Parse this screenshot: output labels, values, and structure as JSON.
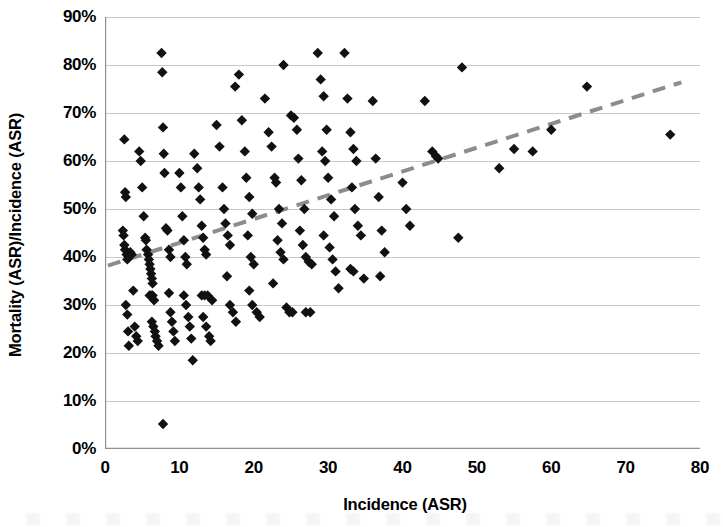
{
  "chart_data": {
    "type": "scatter",
    "title": "",
    "xlabel": "Incidence (ASR)",
    "ylabel": "Mortality (ASR)/Incidence (ASR)",
    "xlim": [
      0,
      80
    ],
    "ylim": [
      0,
      0.9
    ],
    "xticks": [
      "0",
      "10",
      "20",
      "30",
      "40",
      "50",
      "60",
      "70",
      "80"
    ],
    "xtick_values": [
      0,
      10,
      20,
      30,
      40,
      50,
      60,
      70,
      80
    ],
    "yticks": [
      "0%",
      "10%",
      "20%",
      "30%",
      "40%",
      "50%",
      "60%",
      "70%",
      "80%",
      "90%"
    ],
    "ytick_values": [
      0,
      0.1,
      0.2,
      0.3,
      0.4,
      0.5,
      0.6,
      0.7,
      0.8,
      0.9
    ],
    "grid": "horizontal",
    "legend": "none",
    "marker": {
      "shape": "diamond",
      "color": "#111111",
      "size": 8
    },
    "trendline": {
      "type": "linear",
      "style": "dashed",
      "color": "#8c8c8c",
      "width": 4,
      "x_start": 0.4,
      "y_start": 0.382,
      "x_end": 77.5,
      "y_end": 0.764
    },
    "points": [
      [
        2.6,
        0.645
      ],
      [
        2.7,
        0.535
      ],
      [
        2.8,
        0.525
      ],
      [
        2.4,
        0.455
      ],
      [
        2.5,
        0.445
      ],
      [
        2.6,
        0.425
      ],
      [
        2.7,
        0.415
      ],
      [
        2.9,
        0.405
      ],
      [
        3.0,
        0.395
      ],
      [
        2.8,
        0.3
      ],
      [
        3.0,
        0.28
      ],
      [
        3.1,
        0.245
      ],
      [
        3.2,
        0.215
      ],
      [
        3.4,
        0.41
      ],
      [
        3.6,
        0.405
      ],
      [
        3.8,
        0.33
      ],
      [
        4.0,
        0.255
      ],
      [
        4.2,
        0.235
      ],
      [
        4.4,
        0.225
      ],
      [
        4.6,
        0.62
      ],
      [
        4.8,
        0.6
      ],
      [
        5.0,
        0.545
      ],
      [
        5.2,
        0.485
      ],
      [
        5.4,
        0.44
      ],
      [
        5.5,
        0.435
      ],
      [
        5.6,
        0.415
      ],
      [
        5.8,
        0.405
      ],
      [
        5.9,
        0.395
      ],
      [
        6.0,
        0.385
      ],
      [
        6.1,
        0.375
      ],
      [
        6.2,
        0.365
      ],
      [
        6.3,
        0.355
      ],
      [
        6.4,
        0.345
      ],
      [
        6.0,
        0.32
      ],
      [
        6.2,
        0.32
      ],
      [
        6.4,
        0.32
      ],
      [
        6.6,
        0.31
      ],
      [
        6.3,
        0.265
      ],
      [
        6.5,
        0.255
      ],
      [
        6.7,
        0.245
      ],
      [
        6.8,
        0.235
      ],
      [
        7.0,
        0.225
      ],
      [
        7.2,
        0.215
      ],
      [
        7.6,
        0.825
      ],
      [
        7.7,
        0.785
      ],
      [
        7.8,
        0.67
      ],
      [
        7.9,
        0.615
      ],
      [
        8.0,
        0.575
      ],
      [
        8.2,
        0.46
      ],
      [
        8.4,
        0.455
      ],
      [
        8.6,
        0.415
      ],
      [
        8.8,
        0.4
      ],
      [
        8.6,
        0.325
      ],
      [
        8.8,
        0.285
      ],
      [
        9.0,
        0.265
      ],
      [
        9.2,
        0.245
      ],
      [
        9.4,
        0.225
      ],
      [
        7.8,
        0.052
      ],
      [
        10.0,
        0.575
      ],
      [
        10.2,
        0.545
      ],
      [
        10.4,
        0.485
      ],
      [
        10.6,
        0.435
      ],
      [
        10.8,
        0.4
      ],
      [
        11.0,
        0.385
      ],
      [
        10.6,
        0.32
      ],
      [
        10.9,
        0.3
      ],
      [
        11.2,
        0.275
      ],
      [
        11.4,
        0.255
      ],
      [
        11.6,
        0.23
      ],
      [
        11.8,
        0.185
      ],
      [
        12.0,
        0.615
      ],
      [
        12.4,
        0.585
      ],
      [
        12.6,
        0.545
      ],
      [
        12.8,
        0.52
      ],
      [
        13.0,
        0.465
      ],
      [
        13.2,
        0.44
      ],
      [
        13.4,
        0.415
      ],
      [
        13.6,
        0.405
      ],
      [
        13.0,
        0.32
      ],
      [
        13.4,
        0.32
      ],
      [
        13.8,
        0.32
      ],
      [
        13.2,
        0.275
      ],
      [
        13.6,
        0.255
      ],
      [
        14.0,
        0.235
      ],
      [
        14.2,
        0.225
      ],
      [
        14.4,
        0.31
      ],
      [
        15.0,
        0.675
      ],
      [
        15.4,
        0.63
      ],
      [
        15.8,
        0.545
      ],
      [
        16.0,
        0.5
      ],
      [
        16.2,
        0.47
      ],
      [
        16.5,
        0.445
      ],
      [
        16.8,
        0.425
      ],
      [
        16.4,
        0.36
      ],
      [
        16.8,
        0.3
      ],
      [
        17.2,
        0.285
      ],
      [
        17.6,
        0.265
      ],
      [
        17.5,
        0.755
      ],
      [
        18.0,
        0.78
      ],
      [
        18.4,
        0.685
      ],
      [
        18.8,
        0.62
      ],
      [
        19.0,
        0.565
      ],
      [
        19.4,
        0.525
      ],
      [
        19.8,
        0.49
      ],
      [
        19.2,
        0.445
      ],
      [
        19.6,
        0.4
      ],
      [
        20.0,
        0.385
      ],
      [
        19.4,
        0.33
      ],
      [
        19.8,
        0.3
      ],
      [
        20.4,
        0.285
      ],
      [
        20.8,
        0.275
      ],
      [
        21.5,
        0.73
      ],
      [
        22.0,
        0.66
      ],
      [
        22.4,
        0.63
      ],
      [
        22.8,
        0.565
      ],
      [
        23.0,
        0.555
      ],
      [
        23.4,
        0.5
      ],
      [
        23.8,
        0.47
      ],
      [
        23.2,
        0.435
      ],
      [
        23.6,
        0.41
      ],
      [
        24.0,
        0.395
      ],
      [
        22.6,
        0.345
      ],
      [
        24.4,
        0.295
      ],
      [
        24.8,
        0.285
      ],
      [
        25.2,
        0.285
      ],
      [
        24.0,
        0.8
      ],
      [
        25.0,
        0.695
      ],
      [
        25.4,
        0.69
      ],
      [
        25.8,
        0.665
      ],
      [
        26.0,
        0.605
      ],
      [
        26.4,
        0.56
      ],
      [
        26.8,
        0.5
      ],
      [
        26.2,
        0.455
      ],
      [
        26.6,
        0.425
      ],
      [
        27.0,
        0.4
      ],
      [
        27.4,
        0.39
      ],
      [
        27.8,
        0.385
      ],
      [
        27.0,
        0.285
      ],
      [
        27.6,
        0.285
      ],
      [
        28.6,
        0.825
      ],
      [
        29.0,
        0.77
      ],
      [
        29.4,
        0.735
      ],
      [
        29.8,
        0.665
      ],
      [
        29.2,
        0.62
      ],
      [
        29.6,
        0.6
      ],
      [
        30.0,
        0.565
      ],
      [
        30.4,
        0.52
      ],
      [
        30.8,
        0.485
      ],
      [
        29.4,
        0.445
      ],
      [
        30.2,
        0.42
      ],
      [
        30.6,
        0.395
      ],
      [
        31.0,
        0.37
      ],
      [
        31.4,
        0.335
      ],
      [
        32.2,
        0.825
      ],
      [
        32.6,
        0.73
      ],
      [
        33.0,
        0.66
      ],
      [
        33.4,
        0.625
      ],
      [
        33.8,
        0.6
      ],
      [
        33.2,
        0.545
      ],
      [
        33.6,
        0.5
      ],
      [
        34.0,
        0.465
      ],
      [
        34.4,
        0.445
      ],
      [
        33.0,
        0.375
      ],
      [
        33.4,
        0.37
      ],
      [
        34.8,
        0.355
      ],
      [
        36.0,
        0.725
      ],
      [
        36.4,
        0.605
      ],
      [
        36.8,
        0.525
      ],
      [
        37.2,
        0.455
      ],
      [
        37.6,
        0.41
      ],
      [
        37.0,
        0.36
      ],
      [
        40.0,
        0.555
      ],
      [
        40.5,
        0.5
      ],
      [
        41.0,
        0.465
      ],
      [
        43.0,
        0.725
      ],
      [
        44.0,
        0.62
      ],
      [
        44.5,
        0.61
      ],
      [
        44.8,
        0.605
      ],
      [
        47.5,
        0.44
      ],
      [
        48.0,
        0.795
      ],
      [
        53.0,
        0.585
      ],
      [
        55.0,
        0.625
      ],
      [
        57.5,
        0.62
      ],
      [
        60.0,
        0.665
      ],
      [
        64.8,
        0.755
      ],
      [
        76.0,
        0.655
      ]
    ]
  }
}
